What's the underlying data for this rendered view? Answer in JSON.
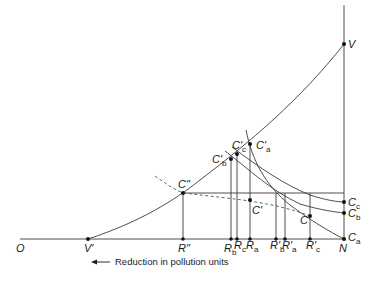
{
  "diagram": {
    "caption": "Reduction in pollution units",
    "axis": {
      "origin_label": "O",
      "right_label": "N"
    },
    "points": {
      "V": "V",
      "V_prime": "V'",
      "C_double": "C\"",
      "C_prime": "C'",
      "C": "C",
      "C_prime_a": "C'",
      "C_prime_b": "C'",
      "C_prime_c": "C'",
      "C_a": "C",
      "C_b": "C",
      "C_c": "C"
    },
    "subscripts": {
      "a": "a",
      "b": "b",
      "c": "c"
    },
    "x_ticks": {
      "R_double": "R\"",
      "R_b": "R",
      "R_c": "R",
      "R_a": "R",
      "R_prime_b": "R'",
      "R_prime_a": "R'",
      "R_prime_c": "R'"
    },
    "colors": {
      "line": "#3a3a3a",
      "text": "#1a1a1a",
      "background": "#ffffff"
    }
  }
}
